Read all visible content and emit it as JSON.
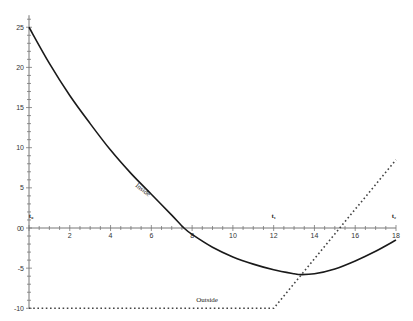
{
  "chart_data": {
    "type": "line",
    "title": "",
    "xlabel": "",
    "ylabel": "",
    "xlim": [
      0,
      18
    ],
    "ylim": [
      -10,
      25
    ],
    "x_ticks": [
      2,
      4,
      6,
      8,
      10,
      12,
      14,
      16,
      18
    ],
    "y_ticks": [
      25,
      20,
      15,
      10,
      5,
      0,
      -5,
      -10
    ],
    "grid": false,
    "series": [
      {
        "name": "Inside",
        "style": "solid",
        "x": [
          0,
          1,
          2,
          3,
          4,
          5,
          6,
          7,
          7.6,
          8,
          9,
          10,
          11,
          12,
          13,
          13.3,
          14,
          15,
          16,
          17,
          18
        ],
        "values": [
          25,
          20.5,
          16.5,
          13,
          9.7,
          6.8,
          4.2,
          1.6,
          0,
          -0.8,
          -2.4,
          -3.6,
          -4.5,
          -5.2,
          -5.7,
          -5.8,
          -5.7,
          -5.1,
          -4.1,
          -2.9,
          -1.5
        ]
      },
      {
        "name": "Outside",
        "style": "dotted",
        "x": [
          0,
          12,
          18
        ],
        "values": [
          -10,
          -10,
          8.5
        ]
      }
    ],
    "annotations": [
      {
        "text": "Inside",
        "x": 5.2,
        "y": 5.2,
        "rotation": 38
      },
      {
        "text": "Outside",
        "x": 8.2,
        "y": -9.2
      },
      {
        "text": "t₀",
        "x": 0.1,
        "y": 1.2
      },
      {
        "text": "t₁",
        "x": 12,
        "y": 1.2
      },
      {
        "text": "t₂",
        "x": 17.9,
        "y": 1.2
      }
    ],
    "legend": "none"
  }
}
